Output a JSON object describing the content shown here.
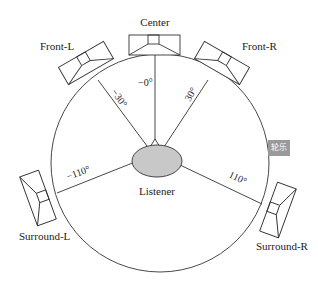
{
  "diagram": {
    "type": "5.1 surround speaker layout",
    "speakers": [
      {
        "label": "Center",
        "angle": "−0°"
      },
      {
        "label": "Front-L",
        "angle": "−30°"
      },
      {
        "label": "Front-R",
        "angle": "30°"
      },
      {
        "label": "Surround-L",
        "angle": "−110°"
      },
      {
        "label": "Surround-R",
        "angle": "110°"
      }
    ],
    "listener": "Listener",
    "watermark": "轮乐"
  }
}
